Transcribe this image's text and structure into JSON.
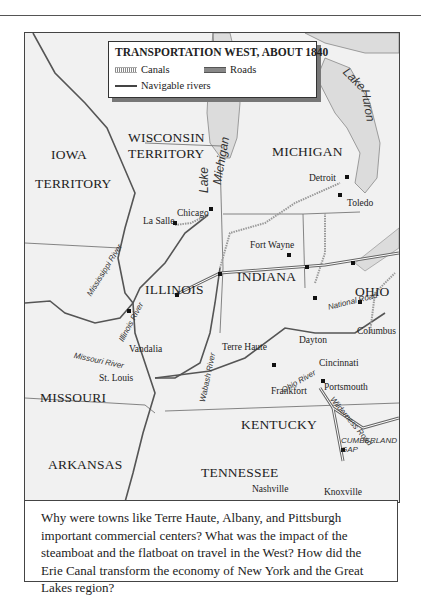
{
  "legend": {
    "title": "TRANSPORTATION WEST,  ABOUT 1840",
    "items": [
      {
        "label": "Canals",
        "symbol": "canal-line"
      },
      {
        "label": "Roads",
        "symbol": "road-line"
      },
      {
        "label": "Navigable rivers",
        "symbol": "river-line"
      }
    ]
  },
  "states": {
    "iowa_1": "IOWA",
    "iowa_2": "TERRITORY",
    "wisconsin_1": "WISCONSIN",
    "wisconsin_2": "TERRITORY",
    "michigan": "MICHIGAN",
    "illinois": "ILLINOIS",
    "indiana": "INDIANA",
    "ohio": "OHIO",
    "missouri": "MISSOURI",
    "kentucky": "KENTUCKY",
    "arkansas": "ARKANSAS",
    "tennessee": "TENNESSEE"
  },
  "cities": {
    "chicago": "Chicago",
    "la_salle": "La Salle",
    "detroit": "Detroit",
    "toledo": "Toledo",
    "fort_wayne": "Fort Wayne",
    "dayton": "Dayton",
    "columbus": "Columbus",
    "terre_haute": "Terre Haute",
    "vandalia": "Vandalia",
    "cincinnati": "Cincinnati",
    "portsmouth": "Portsmouth",
    "st_louis": "St. Louis",
    "frankfort": "Frankfort",
    "nashville": "Nashville",
    "knoxville": "Knoxville"
  },
  "water": {
    "lake_michigan_1": "Lake",
    "lake_michigan_2": "Michigan",
    "lake_huron_1": "Lake",
    "lake_huron_2": "Huron",
    "mississippi": "Mississippi River",
    "illinois_river": "Illinois River",
    "missouri_river": "Missouri River",
    "wabash": "Wabash River",
    "ohio_river": "Ohio River"
  },
  "routes": {
    "national_road": "National Road",
    "wilderness_road": "Wilderness Road",
    "cumberland_gap_1": "CUMBERLAND",
    "cumberland_gap_2": "GAP"
  },
  "caption": "Why were towns like Terre Haute, Albany, and Pittsburgh important commercial centers? What was the impact of the steamboat and the flatboat on travel in the West? How did the Erie Canal transform the economy of New York and the Great Lakes region?"
}
